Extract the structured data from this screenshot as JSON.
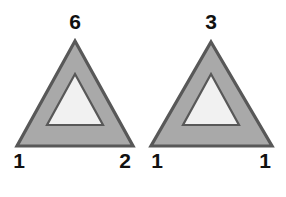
{
  "canvas": {
    "width": 286,
    "height": 197,
    "background_color": "#ffffff"
  },
  "style": {
    "outline_color": "#585858",
    "band_fill_color": "#a9a9a9",
    "inner_fill_color": "#f1f1f1",
    "label_color": "#111111"
  },
  "figures": [
    {
      "name": "left-triangle-figure",
      "shape": "nested-triangle",
      "labels": {
        "apex": "6",
        "bottom_left": "1",
        "bottom_right": "2"
      },
      "outer_points": "75,41 133,146 17,146",
      "inner_points": "75,74 103,125 47,125"
    },
    {
      "name": "right-triangle-figure",
      "shape": "nested-triangle",
      "labels": {
        "apex": "3",
        "bottom_left": "1",
        "bottom_right": "1"
      },
      "outer_points": "211,42 272,146 151,146",
      "inner_points": "211,74 239,125 183,125"
    }
  ]
}
